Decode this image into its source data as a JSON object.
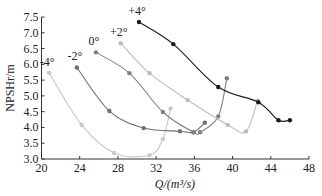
{
  "chart_data": {
    "type": "line",
    "title": "",
    "xlabel": "Q/(m³/s)",
    "ylabel": "NPSHr/m",
    "xlim": [
      20,
      48
    ],
    "ylim": [
      3.0,
      7.5
    ],
    "xticks": [
      20,
      24,
      28,
      32,
      36,
      40,
      44,
      48
    ],
    "yticks": [
      3.0,
      3.5,
      4.0,
      4.5,
      5.0,
      5.5,
      6.0,
      6.5,
      7.0,
      7.5
    ],
    "grid": false,
    "legend": "inline labels at curve starts",
    "series": [
      {
        "name": "-4°",
        "color": "#c8c8c8",
        "points": [
          [
            20.8,
            5.73
          ],
          [
            24.2,
            4.08
          ],
          [
            27.6,
            3.19
          ],
          [
            31.3,
            3.12
          ],
          [
            32.7,
            3.63
          ],
          [
            33.5,
            4.6
          ]
        ]
      },
      {
        "name": "-2°",
        "color": "#707070",
        "points": [
          [
            23.7,
            5.9
          ],
          [
            27.1,
            4.52
          ],
          [
            30.7,
            3.98
          ],
          [
            34.5,
            3.88
          ],
          [
            35.9,
            3.85
          ],
          [
            37.1,
            4.15
          ]
        ]
      },
      {
        "name": "0°",
        "color": "#808080",
        "points": [
          [
            25.7,
            6.38
          ],
          [
            29.2,
            5.72
          ],
          [
            32.7,
            4.49
          ],
          [
            35.9,
            3.85
          ],
          [
            36.6,
            3.85
          ],
          [
            38.5,
            4.35
          ],
          [
            39.4,
            5.56
          ]
        ]
      },
      {
        "name": "+2°",
        "color": "#bdbdbd",
        "points": [
          [
            28.3,
            6.67
          ],
          [
            31.3,
            5.72
          ],
          [
            35.3,
            4.87
          ],
          [
            39.5,
            4.08
          ],
          [
            41.4,
            3.87
          ],
          [
            42.6,
            4.85
          ]
        ]
      },
      {
        "name": "+4°",
        "color": "#1a1a1a",
        "points": [
          [
            30.2,
            7.34
          ],
          [
            33.8,
            6.64
          ],
          [
            38.5,
            5.28
          ],
          [
            42.7,
            4.8
          ],
          [
            44.8,
            4.23
          ],
          [
            46.0,
            4.23
          ]
        ]
      }
    ]
  }
}
